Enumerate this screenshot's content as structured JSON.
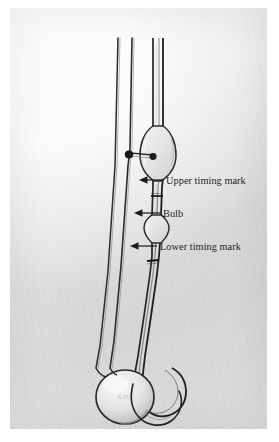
{
  "figure": {
    "kind": "photograph",
    "background_color": "#ececec",
    "page_color": "#ffffff",
    "glass_color": "#2b2b2b",
    "label_color": "#232323",
    "photo_rect": {
      "x": 10,
      "y": 8,
      "width": 257,
      "height": 421
    }
  },
  "annotations": [
    {
      "id": "upper-timing-mark",
      "label": "Upper timing mark",
      "arrow": {
        "tip_x": 139,
        "tip_y": 180,
        "tail_x": 163,
        "tail_y": 180
      },
      "text_x": 166,
      "text_y": 184
    },
    {
      "id": "bulb",
      "label": "Bulb",
      "arrow": {
        "tip_x": 134,
        "tip_y": 213,
        "tail_x": 160,
        "tail_y": 213
      },
      "text_x": 163,
      "text_y": 217
    },
    {
      "id": "lower-timing-mark",
      "label": "Lower timing mark",
      "arrow": {
        "tip_x": 130,
        "tip_y": 246,
        "tail_x": 157,
        "tail_y": 246
      },
      "text_x": 160,
      "text_y": 250
    }
  ],
  "etching": {
    "reservoir_mark": "A3S1"
  },
  "parts": {
    "tube_left_label": "vent tube",
    "tube_middle_label": "filling tube",
    "tube_right_label": "capillary tube",
    "upper_bulb_label": "upper reservoir bulb",
    "timing_bulb_label": "timing bulb",
    "reservoir_label": "lower reservoir bulb",
    "side_arm_label": "side arm",
    "u_bend_label": "u-bend"
  }
}
